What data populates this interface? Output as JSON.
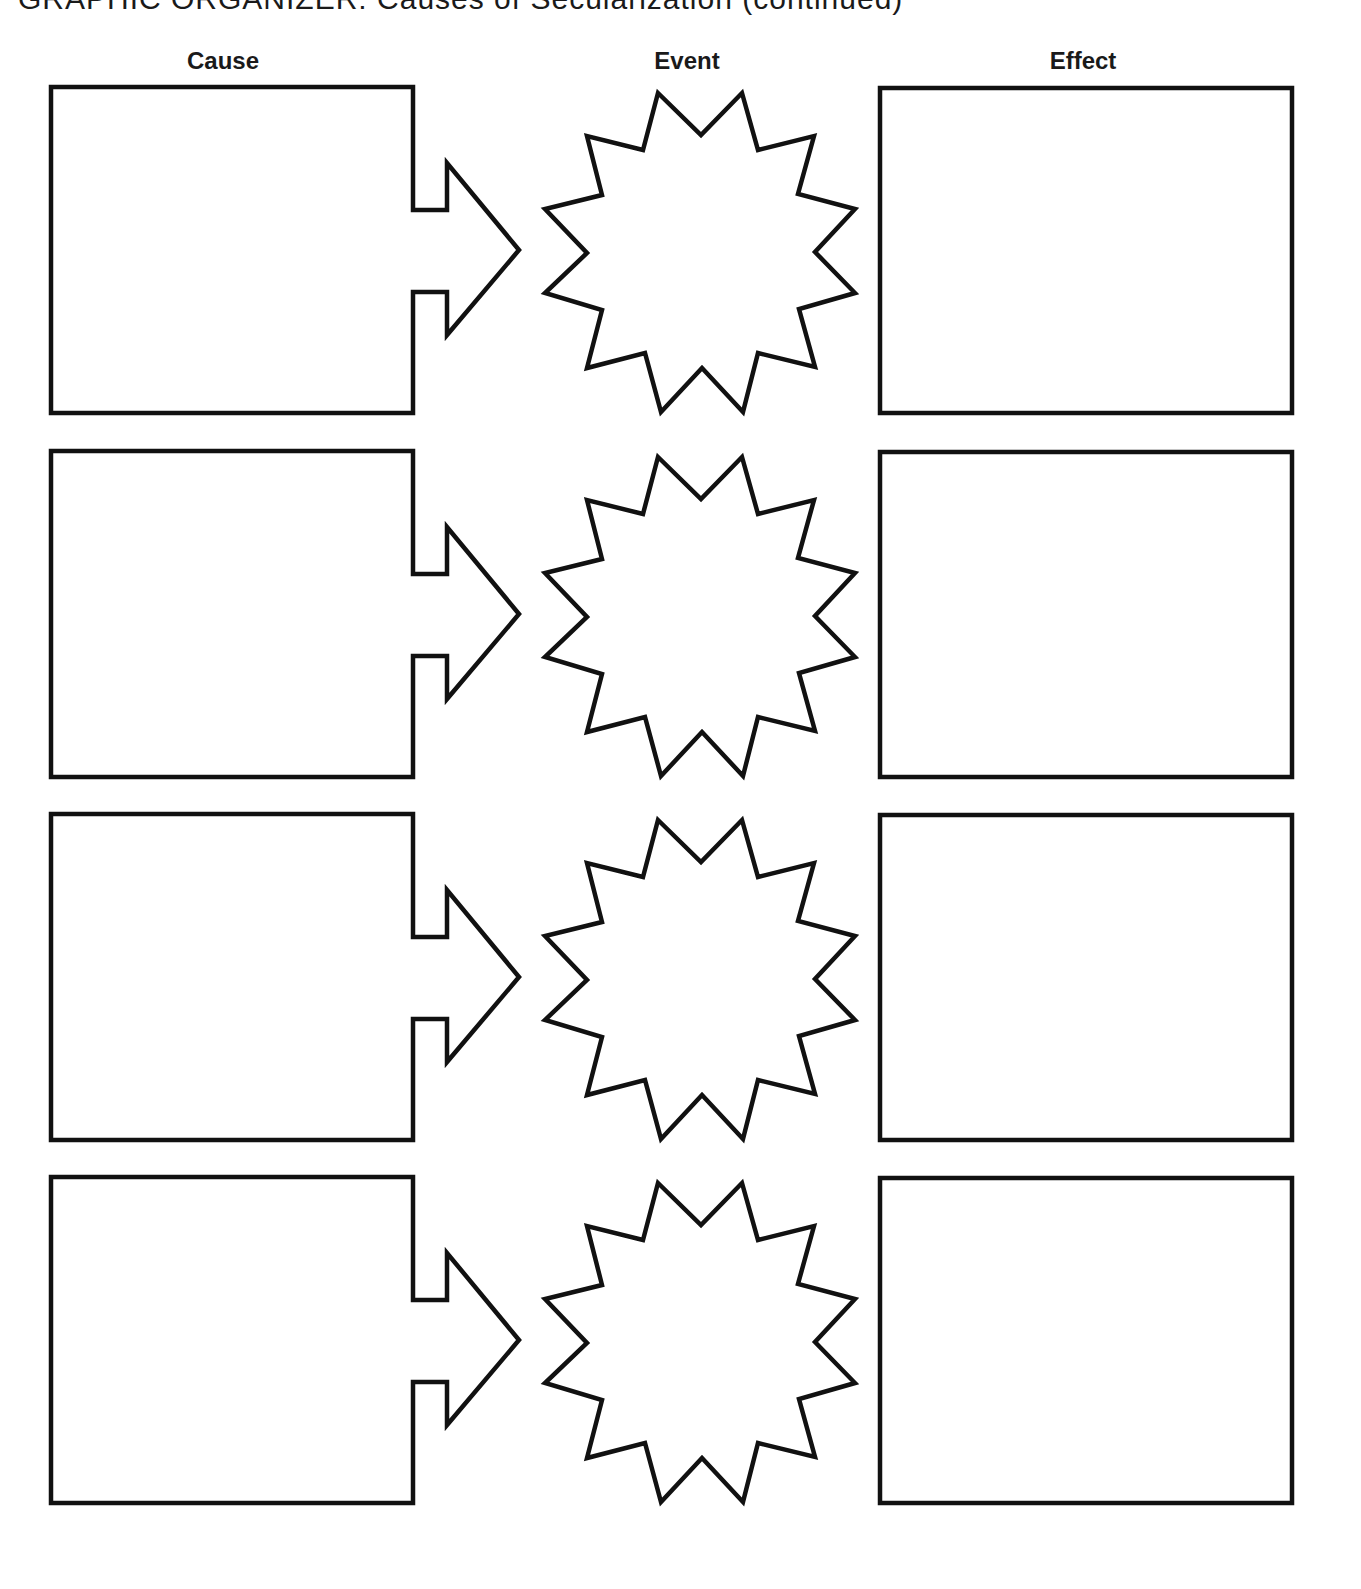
{
  "page": {
    "title": "GRAPHIC ORGANIZER: Causes of Secularization (continued)"
  },
  "columns": {
    "cause": "Cause",
    "event": "Event",
    "effect": "Effect"
  },
  "rows": [
    {
      "cause": "",
      "event": "",
      "effect": ""
    },
    {
      "cause": "",
      "event": "",
      "effect": ""
    },
    {
      "cause": "",
      "event": "",
      "effect": ""
    },
    {
      "cause": "",
      "event": "",
      "effect": ""
    }
  ],
  "shapes": {
    "cause": "arrow-box",
    "event": "12-point-starburst",
    "effect": "rectangle"
  },
  "colors": {
    "stroke": "#111111",
    "background": "#ffffff",
    "text": "#1a1a1a"
  }
}
